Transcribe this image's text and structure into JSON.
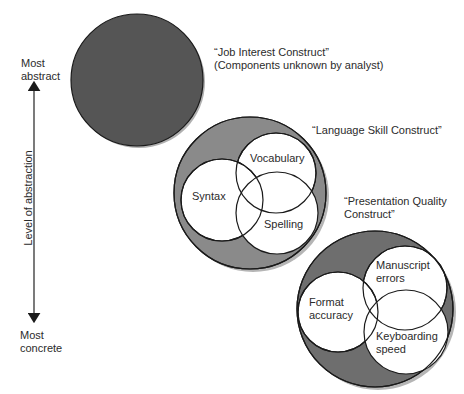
{
  "axis": {
    "top_label_line1": "Most",
    "top_label_line2": "abstract",
    "bottom_label_line1": "Most",
    "bottom_label_line2": "concrete",
    "title": "Level of abstraction"
  },
  "constructs": [
    {
      "title_line1": "“Job Interest Construct”",
      "title_line2": "(Components unknown by analyst)",
      "fill": "#555555",
      "components": []
    },
    {
      "title_line1": "“Language Skill Construct”",
      "title_line2": "",
      "fill": "#8a8a8a",
      "components": [
        {
          "label": "Vocabulary"
        },
        {
          "label": "Syntax"
        },
        {
          "label": "Spelling"
        }
      ]
    },
    {
      "title_line1": "“Presentation Quality",
      "title_line2": "Construct”",
      "fill": "#6e6e6e",
      "components": [
        {
          "label_line1": "Manuscript",
          "label_line2": "errors"
        },
        {
          "label_line1": "Format",
          "label_line2": "accuracy"
        },
        {
          "label_line1": "Keyboarding",
          "label_line2": "speed"
        }
      ]
    }
  ],
  "colors": {
    "stroke": "#1a1a1a",
    "shadow": "#b0b0b0",
    "inner_fill": "#ffffff"
  }
}
